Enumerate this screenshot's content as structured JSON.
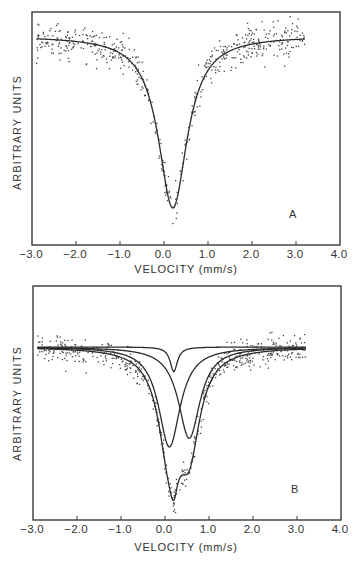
{
  "chart_data": [
    {
      "type": "scatter",
      "panel_label": "A",
      "title": "",
      "xlabel": "VELOCITY (mm/s)",
      "ylabel": "ARBITRARY UNITS",
      "xlim": [
        -3.0,
        4.0
      ],
      "x_ticks": [
        "-3.0",
        "-2.0",
        "-1.0",
        "0.0",
        "1.0",
        "2.0",
        "3.0",
        "4.0"
      ],
      "y_ticks": [],
      "grid": false,
      "legend": null,
      "data_range_x": [
        -2.9,
        3.2
      ],
      "series": [
        {
          "name": "measured spectrum",
          "kind": "scatter points",
          "note": "noisy transmission data points"
        },
        {
          "name": "fitted single line",
          "kind": "line",
          "shape": "lorentzian",
          "center": 0.2,
          "hwhm": 0.4,
          "relative_depth": 1.0
        }
      ]
    },
    {
      "type": "scatter",
      "panel_label": "B",
      "title": "",
      "xlabel": "VELOCITY (mm/s)",
      "ylabel": "ARBITRARY UNITS",
      "xlim": [
        -3.0,
        4.0
      ],
      "x_ticks": [
        "-3.0",
        "-2.0",
        "-1.0",
        "0.0",
        "1.0",
        "2.0",
        "3.0",
        "4.0"
      ],
      "y_ticks": [],
      "grid": false,
      "legend": null,
      "data_range_x": [
        -2.9,
        3.2
      ],
      "series": [
        {
          "name": "measured spectrum",
          "kind": "scatter points",
          "note": "noisy transmission data points"
        },
        {
          "name": "narrow component",
          "kind": "line",
          "shape": "lorentzian",
          "center": 0.2,
          "hwhm": 0.1,
          "relative_depth": 0.17
        },
        {
          "name": "doublet component 1",
          "kind": "line",
          "shape": "lorentzian",
          "center": 0.1,
          "hwhm": 0.3,
          "relative_depth": 0.69
        },
        {
          "name": "doublet component 2",
          "kind": "line",
          "shape": "lorentzian",
          "center": 0.55,
          "hwhm": 0.3,
          "relative_depth": 0.63
        },
        {
          "name": "total fit",
          "kind": "line",
          "shape": "sum of components",
          "minima_x": [
            0.15,
            0.55
          ]
        }
      ]
    }
  ],
  "panels": {
    "a": {
      "tag": "A",
      "ylabel": "ARBITRARY UNITS",
      "xlabel": "VELOCITY (mm/s)",
      "ticks": [
        "-3.0",
        "-2.0",
        "-1.0",
        "0.0",
        "1.0",
        "2.0",
        "3.0",
        "4.0"
      ]
    },
    "b": {
      "tag": "B",
      "ylabel": "ARBITRARY UNITS",
      "xlabel": "VELOCITY (mm/s)",
      "ticks": [
        "-3.0",
        "-2.0",
        "-1.0",
        "0.0",
        "1.0",
        "2.0",
        "3.0",
        "4.0"
      ]
    }
  },
  "colors": {
    "ink": "#2b2b2b",
    "background": "#ffffff"
  }
}
